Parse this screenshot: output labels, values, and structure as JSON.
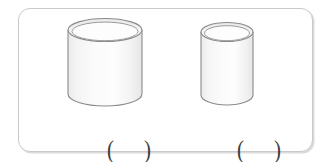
{
  "panel": {
    "border_color": "#c9c9c9",
    "background_color": "#ffffff",
    "corner_radius_px": 12
  },
  "figures": [
    {
      "id": "cylinder-left",
      "shape_name": "open-cylinder",
      "description": "wide short cylinder",
      "outline_color": "#808080",
      "fill_color": "#f7f7f7",
      "width_px": 76,
      "height_px": 82,
      "answer": {
        "open_paren": "(",
        "value": "",
        "close_paren": ")"
      }
    },
    {
      "id": "cylinder-right",
      "shape_name": "open-cylinder",
      "description": "narrow tall cylinder",
      "outline_color": "#808080",
      "fill_color": "#f7f7f7",
      "width_px": 53,
      "height_px": 79,
      "answer": {
        "open_paren": "(",
        "value": "",
        "close_paren": ")"
      }
    }
  ]
}
